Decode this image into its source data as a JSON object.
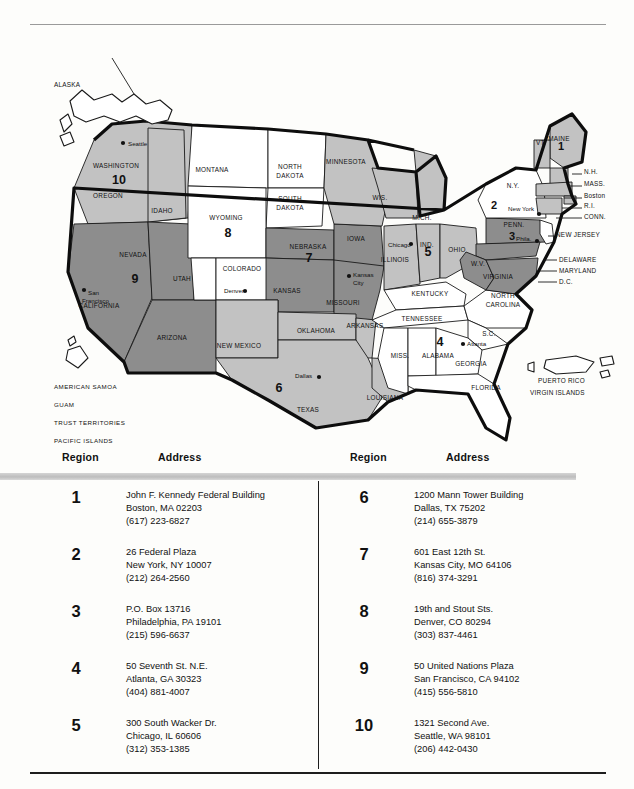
{
  "map": {
    "title": "federal-regions-map",
    "region_numbers": [
      {
        "id": "1",
        "x": 545,
        "y": 122
      },
      {
        "id": "2",
        "x": 478,
        "y": 181
      },
      {
        "id": "3",
        "x": 496,
        "y": 212
      },
      {
        "id": "4",
        "x": 424,
        "y": 318
      },
      {
        "id": "5",
        "x": 412,
        "y": 228
      },
      {
        "id": "6",
        "x": 263,
        "y": 364
      },
      {
        "id": "7",
        "x": 293,
        "y": 234
      },
      {
        "id": "8",
        "x": 212,
        "y": 209
      },
      {
        "id": "9",
        "x": 119,
        "y": 255
      },
      {
        "id": "10",
        "x": 103,
        "y": 156
      }
    ],
    "state_labels": [
      {
        "text": "WASHINGTON",
        "x": 100,
        "y": 140
      },
      {
        "text": "OREGON",
        "x": 92,
        "y": 170
      },
      {
        "text": "IDAHO",
        "x": 146,
        "y": 185
      },
      {
        "text": "MONTANA",
        "x": 196,
        "y": 144
      },
      {
        "text": "WYOMING",
        "x": 210,
        "y": 192
      },
      {
        "text": "NORTH",
        "x": 274,
        "y": 141
      },
      {
        "text": "DAKOTA",
        "x": 274,
        "y": 150
      },
      {
        "text": "SOUTH",
        "x": 274,
        "y": 173
      },
      {
        "text": "DAKOTA",
        "x": 274,
        "y": 182
      },
      {
        "text": "MINNESOTA",
        "x": 330,
        "y": 136
      },
      {
        "text": "WIS.",
        "x": 364,
        "y": 172
      },
      {
        "text": "MICH.",
        "x": 406,
        "y": 192
      },
      {
        "text": "NEBRASKA",
        "x": 292,
        "y": 221
      },
      {
        "text": "IOWA",
        "x": 340,
        "y": 213
      },
      {
        "text": "ILLINOIS",
        "x": 379,
        "y": 234
      },
      {
        "text": "IND.",
        "x": 411,
        "y": 219
      },
      {
        "text": "OHIO",
        "x": 441,
        "y": 224
      },
      {
        "text": "NEVADA",
        "x": 117,
        "y": 229
      },
      {
        "text": "UTAH",
        "x": 166,
        "y": 253
      },
      {
        "text": "COLORADO",
        "x": 226,
        "y": 243
      },
      {
        "text": "KANSAS",
        "x": 271,
        "y": 265
      },
      {
        "text": "MISSOURI",
        "x": 327,
        "y": 277
      },
      {
        "text": "CALIFORNIA",
        "x": 83,
        "y": 280
      },
      {
        "text": "ARIZONA",
        "x": 156,
        "y": 312
      },
      {
        "text": "NEW MEXICO",
        "x": 223,
        "y": 320
      },
      {
        "text": "OKLAHOMA",
        "x": 300,
        "y": 305
      },
      {
        "text": "ARKANSAS",
        "x": 349,
        "y": 300
      },
      {
        "text": "TEXAS",
        "x": 292,
        "y": 384
      },
      {
        "text": "LOUISIANA",
        "x": 369,
        "y": 372
      },
      {
        "text": "KENTUCKY",
        "x": 414,
        "y": 268
      },
      {
        "text": "TENNESSEE",
        "x": 406,
        "y": 293
      },
      {
        "text": "MISS.",
        "x": 384,
        "y": 330
      },
      {
        "text": "ALABAMA",
        "x": 422,
        "y": 330
      },
      {
        "text": "GEORGIA",
        "x": 455,
        "y": 338
      },
      {
        "text": "FLORIDA",
        "x": 470,
        "y": 362
      },
      {
        "text": "S.C.",
        "x": 473,
        "y": 308
      },
      {
        "text": "NORTH",
        "x": 487,
        "y": 270
      },
      {
        "text": "CAROLINA",
        "x": 487,
        "y": 279
      },
      {
        "text": "VIRGINIA",
        "x": 482,
        "y": 251
      },
      {
        "text": "W.V.",
        "x": 462,
        "y": 238
      },
      {
        "text": "PENN.",
        "x": 498,
        "y": 199
      },
      {
        "text": "N.Y.",
        "x": 497,
        "y": 160
      },
      {
        "text": "VT.",
        "x": 525,
        "y": 117
      },
      {
        "text": "MAINE",
        "x": 543,
        "y": 113
      }
    ],
    "callouts": [
      {
        "text": "N.H.",
        "x": 568,
        "y": 146
      },
      {
        "text": "MASS.",
        "x": 568,
        "y": 158
      },
      {
        "text": "Boston",
        "x": 568,
        "y": 170
      },
      {
        "text": "R.I.",
        "x": 568,
        "y": 180
      },
      {
        "text": "CONN.",
        "x": 568,
        "y": 191
      },
      {
        "text": "NEW JERSEY",
        "x": 540,
        "y": 209
      },
      {
        "text": "DELAWARE",
        "x": 543,
        "y": 234
      },
      {
        "text": "MARYLAND",
        "x": 543,
        "y": 245
      },
      {
        "text": "D.C.",
        "x": 543,
        "y": 256
      }
    ],
    "cities": [
      {
        "text": "Seattle",
        "x": 112,
        "y": 118,
        "dot_x": 107,
        "dot_y": 115
      },
      {
        "text": "San",
        "x": 72,
        "y": 267,
        "dot_x": 68,
        "dot_y": 262
      },
      {
        "text": "Francisco",
        "x": 66,
        "y": 275,
        "dot_x": null,
        "dot_y": null
      },
      {
        "text": "Denver",
        "x": 208,
        "y": 265,
        "dot_x": 229,
        "dot_y": 263
      },
      {
        "text": "Kansas",
        "x": 337,
        "y": 249,
        "dot_x": 333,
        "dot_y": 248
      },
      {
        "text": "City",
        "x": 337,
        "y": 257,
        "dot_x": null,
        "dot_y": null
      },
      {
        "text": "Chicago",
        "x": 372,
        "y": 219,
        "dot_x": 395,
        "dot_y": 216
      },
      {
        "text": "Dallas",
        "x": 279,
        "y": 350,
        "dot_x": 303,
        "dot_y": 349
      },
      {
        "text": "Atlanta",
        "x": 451,
        "y": 318,
        "dot_x": 447,
        "dot_y": 316
      },
      {
        "text": "New York",
        "x": 492,
        "y": 183,
        "dot_x": 523,
        "dot_y": 186
      },
      {
        "text": "Phila.",
        "x": 500,
        "y": 213,
        "dot_x": 521,
        "dot_y": 213
      }
    ],
    "insets": [
      {
        "label": "ALASKA",
        "x": 38,
        "y": 59
      },
      {
        "label": "PUERTO RICO",
        "x": 522,
        "y": 355
      },
      {
        "label": "VIRGIN ISLANDS",
        "x": 514,
        "y": 367
      }
    ],
    "territories": [
      {
        "text": "AMERICAN SAMOA",
        "x": 38,
        "y": 361
      },
      {
        "text": "GUAM",
        "x": 38,
        "y": 379
      },
      {
        "text": "TRUST TERRITORIES",
        "x": 38,
        "y": 397
      },
      {
        "text": "PACIFIC ISLANDS",
        "x": 38,
        "y": 415
      },
      {
        "text": "WAKE ISLAND",
        "x": 38,
        "y": 433
      }
    ],
    "colors": {
      "shade_light": "#c2c2c2",
      "shade_dark": "#8d8d8d",
      "shade_white": "#ffffff",
      "outline": "#0d0d0d"
    }
  },
  "table": {
    "headers": {
      "region": "Region",
      "address": "Address"
    },
    "left_column": [
      {
        "region": "1",
        "lines": [
          "John F. Kennedy Federal Building",
          "Boston, MA 02203",
          "(617) 223-6827"
        ]
      },
      {
        "region": "2",
        "lines": [
          "26 Federal Plaza",
          "New York, NY 10007",
          "(212) 264-2560"
        ]
      },
      {
        "region": "3",
        "lines": [
          "P.O. Box 13716",
          "Philadelphia, PA 19101",
          "(215) 596-6637"
        ]
      },
      {
        "region": "4",
        "lines": [
          "50 Seventh St. N.E.",
          "Atlanta, GA 30323",
          "(404) 881-4007"
        ]
      },
      {
        "region": "5",
        "lines": [
          "300 South Wacker Dr.",
          "Chicago, IL 60606",
          "(312) 353-1385"
        ]
      }
    ],
    "right_column": [
      {
        "region": "6",
        "lines": [
          "1200 Mann Tower Building",
          "Dallas, TX 75202",
          "(214) 655-3879"
        ]
      },
      {
        "region": "7",
        "lines": [
          "601 East 12th St.",
          "Kansas City, MO 64106",
          "(816) 374-3291"
        ]
      },
      {
        "region": "8",
        "lines": [
          "19th and Stout Sts.",
          "Denver, CO 80294",
          "(303) 837-4461"
        ]
      },
      {
        "region": "9",
        "lines": [
          "50 United Nations Plaza",
          "San Francisco, CA 94102",
          "(415) 556-5810"
        ]
      },
      {
        "region": "10",
        "lines": [
          "1321 Second Ave.",
          "Seattle, WA 98101",
          "(206) 442-0430"
        ]
      }
    ]
  }
}
